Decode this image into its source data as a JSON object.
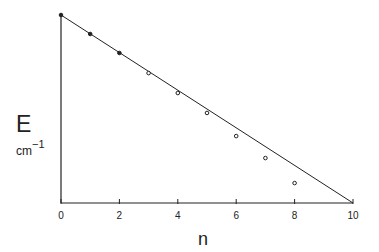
{
  "chart_data": {
    "type": "scatter",
    "title": "",
    "xlabel": "n",
    "ylabel": "E",
    "ylabel_unit_base": "cm",
    "ylabel_unit_exp": "−1",
    "xlim": [
      0,
      10
    ],
    "ylim": [
      0,
      1
    ],
    "x_ticks": [
      0,
      2,
      4,
      6,
      8,
      10
    ],
    "y_ticks": [],
    "grid": false,
    "legend": null,
    "series": [
      {
        "name": "measured levels",
        "marker": "open-circle",
        "x": [
          0,
          1,
          2,
          3,
          4,
          5,
          6,
          7,
          8
        ],
        "y": [
          1.0,
          0.899,
          0.798,
          0.691,
          0.585,
          0.479,
          0.356,
          0.239,
          0.106
        ]
      },
      {
        "name": "linear reference",
        "type": "line",
        "x": [
          0,
          10
        ],
        "y": [
          1.0,
          0.0
        ]
      }
    ]
  },
  "axis": {
    "x_tick_labels": [
      "0",
      "2",
      "4",
      "6",
      "8",
      "10"
    ],
    "x_label": "n",
    "y_label": "E",
    "y_unit_base": "cm",
    "y_unit_exp": "−1"
  }
}
